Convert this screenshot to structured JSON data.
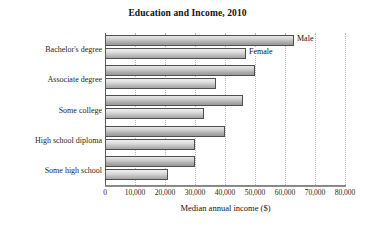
{
  "chart_data": {
    "type": "bar",
    "orientation": "horizontal",
    "title": "Education and Income, 2010",
    "xlabel": "Median annual income ($)",
    "ylabel": "",
    "xlim": [
      0,
      80000
    ],
    "xticks": [
      0,
      10000,
      20000,
      30000,
      40000,
      50000,
      60000,
      70000,
      80000
    ],
    "xtick_labels": [
      "0",
      "10,000",
      "20,000",
      "30,000",
      "40,000",
      "50,000",
      "60,000",
      "70,000",
      "80,000"
    ],
    "grid": "vertical-dotted",
    "legend_position": "inline-annotation-first-group",
    "categories": [
      "Bachelor's degree",
      "Associate degree",
      "Some college",
      "High school diploma",
      "Some high school"
    ],
    "series": [
      {
        "name": "Male",
        "values": [
          63000,
          50000,
          46000,
          40000,
          30000
        ]
      },
      {
        "name": "Female",
        "values": [
          47000,
          37000,
          33000,
          30000,
          21000
        ]
      }
    ],
    "annotations": [
      {
        "text": "Male",
        "series": "Male",
        "category": "Bachelor's degree"
      },
      {
        "text": "Female",
        "series": "Female",
        "category": "Bachelor's degree"
      }
    ],
    "colors": {
      "male_bar": "#b4b4b4",
      "female_bar": "#c4c4c4",
      "bar_outline": "#4f4f4f",
      "gridline": "#b9b9b9",
      "axis": "#5a5a5a",
      "text": "#1a1a1a",
      "background": "#ffffff"
    }
  }
}
